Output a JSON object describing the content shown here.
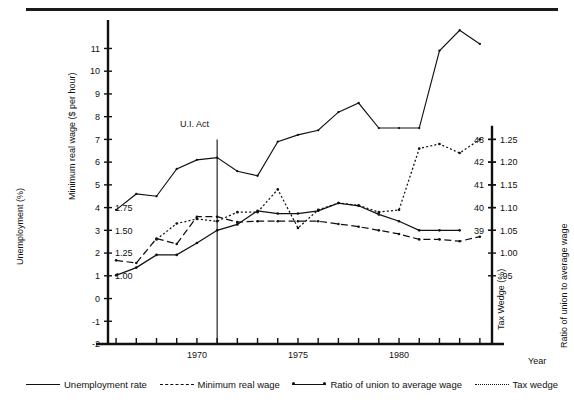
{
  "figure": {
    "axis_titles": {
      "left_outer": "Unemployment (%)",
      "left_inner": "Minimum real wage ($ per hour)",
      "right_inner": "Tax Wedge (%)",
      "right_outer": "Ratio of union to average wage",
      "x_axis": "Year"
    },
    "annotation": {
      "label": "U.I. Act",
      "year": 1971
    },
    "legend": [
      {
        "label": "Unemployment rate",
        "style": "solid",
        "key": "solid-line-key"
      },
      {
        "label": "Minimum real wage",
        "style": "dashed",
        "key": "dashed-line-key"
      },
      {
        "label": "Ratio of union to average wage",
        "style": "dot-line-dot",
        "key": "dot-line-dot-key"
      },
      {
        "label": "Tax wedge",
        "style": "dotted",
        "key": "dotted-line-key"
      }
    ]
  },
  "chart_data": {
    "type": "line",
    "title": "",
    "xlabel": "Year",
    "ylabel": "Unemployment (%)",
    "grid": false,
    "legend_position": "bottom",
    "x": [
      1966,
      1967,
      1968,
      1969,
      1970,
      1971,
      1972,
      1973,
      1974,
      1975,
      1976,
      1977,
      1978,
      1979,
      1980,
      1981,
      1982,
      1983,
      1984
    ],
    "axes": {
      "left_outer": {
        "label": "Unemployment (%)",
        "ticks": [
          -2,
          -1,
          0,
          1,
          2,
          3,
          4,
          5,
          6,
          7,
          8,
          9,
          10,
          11
        ],
        "tick_labels": [
          "-2",
          "-1",
          "0",
          "1",
          "2",
          "3",
          "4",
          "5",
          "6",
          "7",
          "8",
          "9",
          "10",
          "11"
        ],
        "range": [
          -2,
          11.9
        ]
      },
      "left_inner": {
        "label": "Minimum real wage ($ per hour)",
        "ticks": [
          1.0,
          1.25,
          1.5,
          1.75
        ],
        "tick_labels": [
          "1.00",
          "1.25",
          "1.50",
          "1.75"
        ],
        "aligned_to_left_outer": [
          1,
          2,
          3,
          4
        ]
      },
      "right_inner": {
        "label": "Tax Wedge (%)",
        "ticks": [
          39,
          40,
          41,
          42,
          43
        ],
        "tick_labels": [
          "39",
          "40",
          "41",
          "42",
          "43"
        ],
        "aligned_to_left_outer": [
          3,
          4,
          5,
          6,
          7
        ]
      },
      "right_outer": {
        "label": "Ratio of union to average wage",
        "ticks": [
          0.95,
          1.0,
          1.05,
          1.1,
          1.15,
          1.2,
          1.25
        ],
        "tick_labels": [
          ".95",
          "1.00",
          "1.05",
          "1.10",
          "1.15",
          "1.20",
          "1.25"
        ],
        "aligned_to_left_outer": [
          1,
          2,
          3,
          4,
          5,
          6,
          7
        ]
      },
      "x": {
        "ticks": [
          1966,
          1967,
          1968,
          1969,
          1970,
          1971,
          1972,
          1973,
          1974,
          1975,
          1976,
          1977,
          1978,
          1979,
          1980,
          1981,
          1982,
          1983,
          1984
        ],
        "labeled_ticks": [
          1970,
          1975,
          1980
        ],
        "labels": [
          "1970",
          "1975",
          "1980"
        ],
        "range": [
          1965.6,
          1984.6
        ]
      }
    },
    "series": [
      {
        "name": "Unemployment rate",
        "style": "solid",
        "axis": "left_outer",
        "units": "%",
        "x": [
          1966,
          1967,
          1968,
          1969,
          1970,
          1971,
          1972,
          1973,
          1974,
          1975,
          1976,
          1977,
          1978,
          1979,
          1980,
          1981,
          1982,
          1983,
          1984
        ],
        "values": [
          3.9,
          4.6,
          4.5,
          5.7,
          6.1,
          6.2,
          5.6,
          5.4,
          6.9,
          7.2,
          7.4,
          8.2,
          8.6,
          7.5,
          7.5,
          7.5,
          10.9,
          11.8,
          11.2
        ]
      },
      {
        "name": "Minimum real wage",
        "style": "dashed",
        "axis": "left_inner",
        "units": "$ per hour",
        "x": [
          1966,
          1967,
          1968,
          1969,
          1970,
          1971,
          1972,
          1973,
          1974,
          1975,
          1976,
          1977,
          1978,
          1979,
          1980,
          1981,
          1982,
          1983,
          1984
        ],
        "values": [
          1.17,
          1.14,
          1.41,
          1.35,
          1.65,
          1.65,
          1.59,
          1.6,
          1.6,
          1.6,
          1.6,
          1.57,
          1.54,
          1.5,
          1.46,
          1.4,
          1.4,
          1.38,
          1.43
        ]
      },
      {
        "name": "Ratio of union to average wage",
        "style": "dot-line-dot",
        "axis": "right_outer",
        "units": "ratio",
        "x": [
          1966,
          1967,
          1968,
          1969,
          1970,
          1971,
          1972,
          1973,
          1974,
          1975,
          1976,
          1977,
          1978,
          1979,
          1980,
          1981,
          1982,
          1983
        ],
        "values": [
          0.951,
          0.968,
          0.996,
          0.996,
          1.022,
          1.05,
          1.063,
          1.093,
          1.087,
          1.087,
          1.093,
          1.11,
          1.104,
          1.085,
          1.07,
          1.05,
          1.05,
          1.05
        ]
      },
      {
        "name": "Tax wedge",
        "style": "dotted",
        "axis": "right_inner",
        "units": "%",
        "x": [
          1968,
          1969,
          1970,
          1971,
          1972,
          1973,
          1974,
          1975,
          1976,
          1977,
          1978,
          1979,
          1980,
          1981,
          1982,
          1983,
          1984
        ],
        "values": [
          38.6,
          39.3,
          39.5,
          39.4,
          39.8,
          39.8,
          40.8,
          39.1,
          39.9,
          40.2,
          40.1,
          39.8,
          39.9,
          42.6,
          42.8,
          42.4,
          43.0
        ]
      }
    ]
  }
}
